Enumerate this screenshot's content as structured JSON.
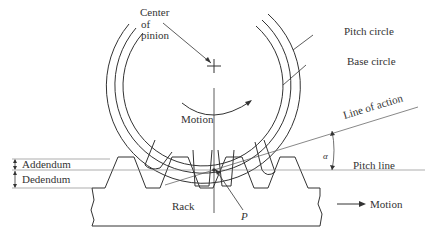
{
  "diagram": {
    "labels": {
      "center_of_pinion_line1": "Center",
      "center_of_pinion_line2": "of",
      "center_of_pinion_line3": "pinion",
      "pitch_circle": "Pitch circle",
      "base_circle": "Base circle",
      "pinion_motion": "Motion",
      "line_of_action": "Line of action",
      "pressure_angle": "α",
      "pitch_line": "Pitch line",
      "addendum": "Addendum",
      "dedendum": "Dedendum",
      "rack": "Rack",
      "pitch_point": "P",
      "rack_motion": "Motion"
    },
    "colors": {
      "line": "#333333",
      "thin_line": "#777777",
      "background": "#ffffff"
    }
  }
}
